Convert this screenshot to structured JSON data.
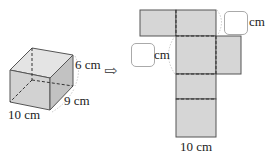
{
  "diagram": {
    "type": "rectangular prism and its net",
    "prism": {
      "labels": {
        "height": "6 cm",
        "depth": "9 cm",
        "width": "10 cm"
      }
    },
    "arrow": {
      "symbol": "⇨"
    },
    "net": {
      "labels": {
        "bottom": "10 cm",
        "unit_top": "cm",
        "unit_left": "cm"
      },
      "blanks": 2
    },
    "colors": {
      "face": "#d6d6d6",
      "face_dark": "#c4c4c4",
      "stroke": "#555555",
      "dash": "#333333"
    }
  }
}
